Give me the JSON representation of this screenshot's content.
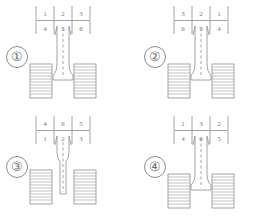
{
  "figure": {
    "type": "technical-line-drawing",
    "stroke_color": "#8d8d8d",
    "text_color": "#7a7a7a",
    "background_color": "#ffffff"
  },
  "panels": [
    {
      "label": "①",
      "label_name": "circled-one",
      "orientation": "nozzle-down",
      "grid": {
        "rows": [
          [
            "1",
            "2",
            "3"
          ],
          [
            "4",
            "5",
            "6"
          ]
        ]
      }
    },
    {
      "label": "②",
      "label_name": "circled-two",
      "orientation": "nozzle-down",
      "grid": {
        "rows": [
          [
            "3",
            "2",
            "1"
          ],
          [
            "6",
            "5",
            "4"
          ]
        ]
      }
    },
    {
      "label": "③",
      "label_name": "circled-three",
      "orientation": "nozzle-up",
      "grid": {
        "rows": [
          [
            "4",
            "6",
            "5"
          ],
          [
            "1",
            "2",
            "3"
          ]
        ]
      }
    },
    {
      "label": "④",
      "label_name": "circled-four",
      "orientation": "nozzle-down",
      "grid": {
        "rows": [
          [
            "1",
            "3",
            "2"
          ],
          [
            "4",
            "6",
            "5"
          ]
        ]
      }
    }
  ]
}
